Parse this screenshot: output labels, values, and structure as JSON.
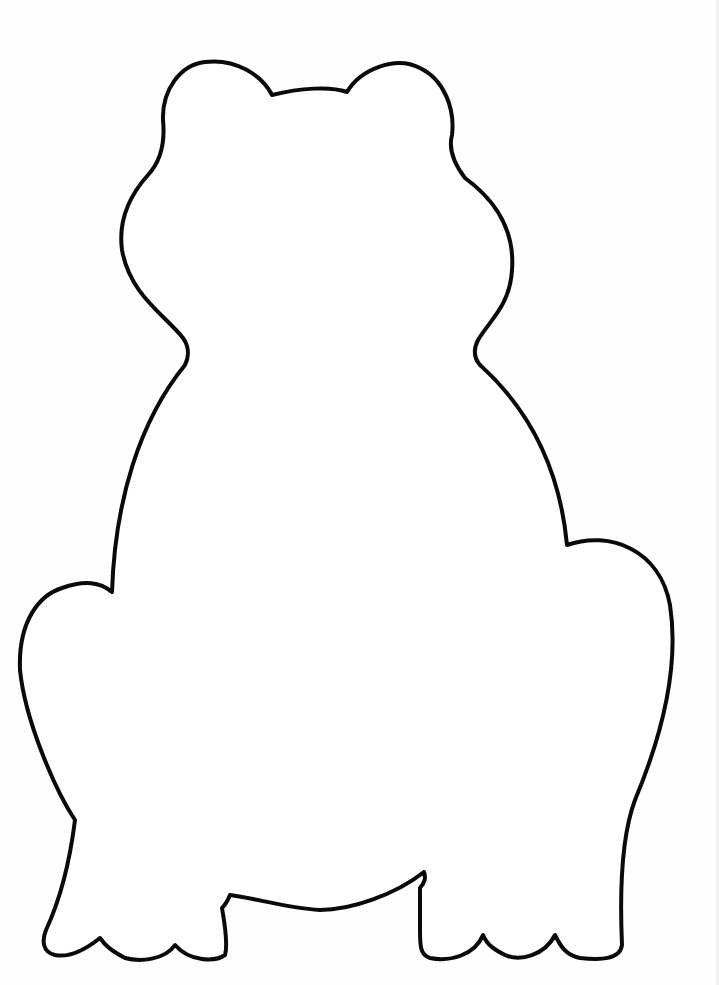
{
  "image": {
    "subject": "Frog outline coloring page",
    "description": "Black outline of a sitting frog seen from the front on a white page",
    "colors": {
      "background": "#fefefe",
      "outline": "#0a0a0a",
      "fill": "#ffffff"
    }
  }
}
